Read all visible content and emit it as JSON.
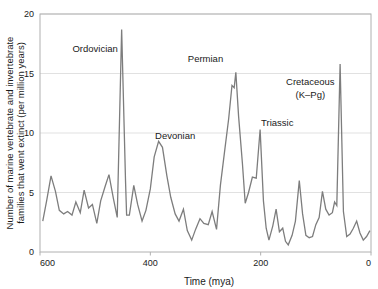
{
  "chart_data": {
    "type": "line",
    "title": "",
    "subtitle": "",
    "xlabel": "Time (mya)",
    "ylabel": "Number of marine vertebrate and invertebrate families that went extinct (per million years)",
    "ylabel_line1": "Number of marine vertebrate and invertebrate",
    "ylabel_line2": "families that went extinct (per million years)",
    "xlim": [
      600,
      0
    ],
    "ylim": [
      0,
      20
    ],
    "x_axis_reversed": true,
    "grid": "horizontal",
    "legend": "none",
    "line_color": "#7d7d7d",
    "xticks": [
      "600",
      "400",
      "200",
      "0"
    ],
    "xtick_values": [
      600,
      400,
      200,
      0
    ],
    "yticks": [
      "0",
      "5",
      "10",
      "15",
      "20"
    ],
    "ytick_values": [
      0,
      5,
      10,
      15,
      20
    ],
    "series_name": "Extinction intensity",
    "x": [
      595,
      588,
      580,
      572,
      565,
      557,
      550,
      542,
      535,
      527,
      520,
      512,
      505,
      497,
      490,
      482,
      475,
      467,
      460,
      452,
      445,
      443,
      438,
      430,
      423,
      415,
      408,
      400,
      393,
      385,
      378,
      370,
      363,
      355,
      348,
      340,
      333,
      325,
      318,
      310,
      303,
      295,
      288,
      280,
      273,
      265,
      258,
      252,
      248,
      245,
      240,
      233,
      228,
      222,
      215,
      208,
      201,
      195,
      190,
      185,
      178,
      172,
      166,
      160,
      155,
      150,
      143,
      137,
      130,
      124,
      118,
      112,
      106,
      100,
      94,
      88,
      82,
      76,
      70,
      66,
      62,
      56,
      50,
      44,
      38,
      32,
      26,
      20,
      14,
      8,
      2
    ],
    "y": [
      2.6,
      4.3,
      6.4,
      5.1,
      3.5,
      3.2,
      3.4,
      3.1,
      4.2,
      3.3,
      5.2,
      3.7,
      4.0,
      2.4,
      4.3,
      5.5,
      6.5,
      4.5,
      2.9,
      18.7,
      6.0,
      3.1,
      3.1,
      5.6,
      4.0,
      2.6,
      3.5,
      5.3,
      8.0,
      9.3,
      8.8,
      6.4,
      4.6,
      3.2,
      2.6,
      3.6,
      1.8,
      1.0,
      1.9,
      2.8,
      2.4,
      2.3,
      3.4,
      1.9,
      5.6,
      8.6,
      11.2,
      14.0,
      13.8,
      15.1,
      11.4,
      7.4,
      4.1,
      5.0,
      6.3,
      6.2,
      10.3,
      4.3,
      2.0,
      1.0,
      2.2,
      3.6,
      1.7,
      2.0,
      0.9,
      0.6,
      1.4,
      2.6,
      6.0,
      3.2,
      1.4,
      1.2,
      1.3,
      2.3,
      2.9,
      5.1,
      3.6,
      3.1,
      3.3,
      4.2,
      3.9,
      15.8,
      3.4,
      1.3,
      1.5,
      2.0,
      2.6,
      1.6,
      1.0,
      1.3,
      1.8
    ],
    "annotations": [
      {
        "id": "ordovician",
        "text": "Ordovician",
        "x": 500,
        "y": 16.8
      },
      {
        "id": "devonian",
        "text": "Devonian",
        "x": 355,
        "y": 9.5
      },
      {
        "id": "permian",
        "text": "Permian",
        "x": 300,
        "y": 16.0
      },
      {
        "id": "triassic",
        "text": "Triassic",
        "x": 170,
        "y": 10.6
      },
      {
        "id": "cretaceous-line1",
        "text": "Cretaceous",
        "x": 110,
        "y": 14.0
      },
      {
        "id": "cretaceous-line2",
        "text": "(K–Pg)",
        "x": 110,
        "y": 12.9
      }
    ]
  }
}
